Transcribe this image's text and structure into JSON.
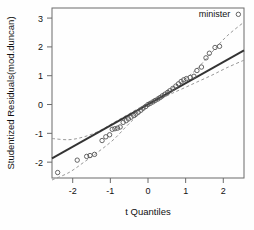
{
  "chart_data": {
    "type": "scatter",
    "title": "",
    "xlabel": "t Quantiles",
    "ylabel": "Studentized Residuals(mod.duncan)",
    "xlim": [
      -2.55,
      2.55
    ],
    "ylim": [
      -2.55,
      3.35
    ],
    "xticks": [
      -2,
      -1,
      0,
      1,
      2
    ],
    "xticklabels": [
      "-2",
      "-1",
      "0",
      "1",
      "2"
    ],
    "yticks": [
      -2,
      -1,
      0,
      1,
      2,
      3
    ],
    "yticklabels": [
      "-2",
      "-1",
      "0",
      "1",
      "2",
      "3"
    ],
    "grid": false,
    "legend": null,
    "series": [
      {
        "name": "Studentized residuals",
        "marker": "open-circle",
        "color": "#555555",
        "points": [
          [
            -2.4,
            -2.36
          ],
          [
            -1.88,
            -1.93
          ],
          [
            -1.63,
            -1.8
          ],
          [
            -1.54,
            -1.77
          ],
          [
            -1.42,
            -1.73
          ],
          [
            -1.22,
            -1.25
          ],
          [
            -1.12,
            -1.12
          ],
          [
            -1.02,
            -1.05
          ],
          [
            -0.95,
            -0.86
          ],
          [
            -0.88,
            -0.84
          ],
          [
            -0.81,
            -0.82
          ],
          [
            -0.74,
            -0.78
          ],
          [
            -0.66,
            -0.62
          ],
          [
            -0.58,
            -0.56
          ],
          [
            -0.52,
            -0.5
          ],
          [
            -0.45,
            -0.44
          ],
          [
            -0.38,
            -0.38
          ],
          [
            -0.32,
            -0.33
          ],
          [
            -0.26,
            -0.27
          ],
          [
            -0.19,
            -0.2
          ],
          [
            -0.13,
            -0.13
          ],
          [
            -0.06,
            -0.07
          ],
          [
            0.0,
            0.0
          ],
          [
            0.06,
            0.04
          ],
          [
            0.13,
            0.09
          ],
          [
            0.19,
            0.14
          ],
          [
            0.26,
            0.19
          ],
          [
            0.32,
            0.24
          ],
          [
            0.38,
            0.3
          ],
          [
            0.45,
            0.36
          ],
          [
            0.52,
            0.42
          ],
          [
            0.58,
            0.48
          ],
          [
            0.66,
            0.56
          ],
          [
            0.74,
            0.64
          ],
          [
            0.81,
            0.72
          ],
          [
            0.88,
            0.8
          ],
          [
            0.95,
            0.86
          ],
          [
            1.02,
            0.9
          ],
          [
            1.12,
            0.94
          ],
          [
            1.22,
            0.98
          ],
          [
            1.3,
            1.18
          ],
          [
            1.42,
            1.3
          ],
          [
            1.54,
            1.62
          ],
          [
            1.63,
            1.78
          ],
          [
            1.78,
            1.98
          ],
          [
            1.9,
            2.02
          ],
          [
            2.4,
            3.13
          ]
        ]
      }
    ],
    "reference_line": {
      "name": "qq-reference-line",
      "style": "solid",
      "color": "#333333",
      "x": [
        -2.55,
        2.55
      ],
      "y": [
        -1.87,
        1.88
      ]
    },
    "confidence_bands": {
      "name": "pointwise-confidence-envelope",
      "style": "dashed",
      "color": "#999999",
      "upper": [
        [
          -2.55,
          -1.18
        ],
        [
          -2.1,
          -1.22
        ],
        [
          -1.7,
          -1.12
        ],
        [
          -1.3,
          -0.92
        ],
        [
          -0.9,
          -0.62
        ],
        [
          -0.5,
          -0.32
        ],
        [
          0.0,
          0.06
        ],
        [
          0.5,
          0.46
        ],
        [
          0.9,
          0.8
        ],
        [
          1.3,
          1.24
        ],
        [
          1.7,
          1.82
        ],
        [
          2.1,
          2.38
        ],
        [
          2.55,
          2.86
        ]
      ],
      "lower": [
        [
          -2.55,
          -2.62
        ],
        [
          -2.1,
          -2.36
        ],
        [
          -1.7,
          -2.0
        ],
        [
          -1.3,
          -1.62
        ],
        [
          -0.9,
          -1.2
        ],
        [
          -0.5,
          -0.66
        ],
        [
          0.0,
          -0.06
        ],
        [
          0.5,
          0.3
        ],
        [
          0.9,
          0.54
        ],
        [
          1.3,
          0.78
        ],
        [
          1.7,
          1.02
        ],
        [
          2.1,
          1.28
        ],
        [
          2.55,
          1.54
        ]
      ]
    },
    "annotations": [
      {
        "name": "minister",
        "text": "minister",
        "x": 2.4,
        "y": 3.13,
        "anchor": "left-of-point"
      }
    ]
  }
}
